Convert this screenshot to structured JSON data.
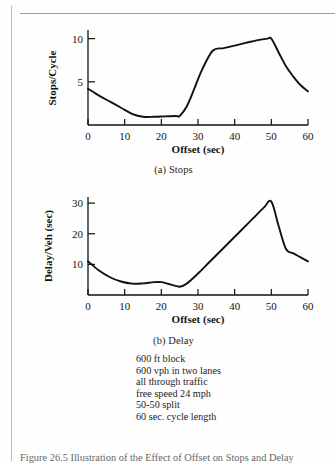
{
  "figure": {
    "caption": "Figure 26.5   Illustration of the Effect of Offset on Stops and Delay"
  },
  "notes": [
    "600 ft block",
    "600 vph in two lanes",
    "all through traffic",
    "free speed 24 mph",
    "50-50 split",
    "60 sec. cycle length"
  ],
  "panel_a": {
    "subcaption": "(a) Stops"
  },
  "panel_b": {
    "subcaption": "(b) Delay"
  },
  "chart_data": [
    {
      "type": "line",
      "title": "(a) Stops",
      "xlabel": "Offset (sec)",
      "ylabel": "Stops/Cycle",
      "xlim": [
        0,
        60
      ],
      "ylim": [
        0,
        11
      ],
      "xticks": [
        0,
        10,
        20,
        30,
        40,
        50,
        60
      ],
      "yticks": [
        5,
        10
      ],
      "grid": false,
      "legend": "none",
      "x": [
        0,
        3,
        6,
        9,
        12,
        15,
        18,
        21,
        24,
        25,
        27,
        29,
        31,
        34,
        37,
        40,
        43,
        46,
        49,
        50,
        52,
        54,
        56,
        58,
        60
      ],
      "values": [
        4.2,
        3.4,
        2.7,
        2.0,
        1.3,
        0.95,
        0.95,
        1.0,
        1.05,
        1.05,
        2.2,
        4.2,
        6.3,
        8.6,
        8.9,
        9.2,
        9.5,
        9.8,
        10.0,
        10.0,
        8.4,
        6.8,
        5.6,
        4.6,
        3.9
      ]
    },
    {
      "type": "line",
      "title": "(b) Delay",
      "xlabel": "Offset (sec)",
      "ylabel": "Delay/Veh (sec)",
      "xlim": [
        0,
        60
      ],
      "ylim": [
        0,
        32
      ],
      "xticks": [
        0,
        10,
        20,
        30,
        40,
        50,
        60
      ],
      "yticks": [
        10,
        20,
        30
      ],
      "grid": false,
      "legend": "none",
      "x": [
        0,
        3,
        6,
        9,
        12,
        15,
        18,
        20,
        22,
        25,
        27,
        30,
        33,
        36,
        39,
        42,
        45,
        48,
        50,
        52,
        54,
        56,
        58,
        60
      ],
      "values": [
        11.0,
        8.0,
        5.8,
        4.4,
        3.7,
        3.8,
        4.2,
        4.2,
        3.6,
        2.7,
        3.8,
        7.0,
        10.6,
        14.2,
        17.8,
        21.4,
        25.0,
        28.6,
        30.5,
        22.5,
        15.0,
        13.6,
        12.3,
        11.0
      ]
    }
  ],
  "colors": {
    "curve": "#111111",
    "axis": "#111111",
    "page_rule": "#b9b9bb",
    "text": "#1a1a1a"
  }
}
